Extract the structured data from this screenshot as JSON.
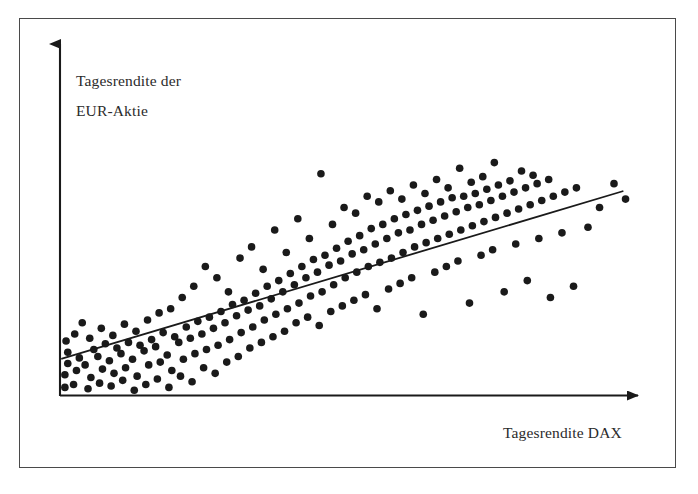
{
  "figure": {
    "type": "scatter-plot",
    "background_color": "#ffffff",
    "frame_color": "#4a4a4a",
    "axis_color": "#1a1a1a",
    "point_color": "#1a1a1a",
    "regression_line_color": "#1a1a1a",
    "text_color": "#2b2b2b"
  },
  "axes": {
    "y_label_line_1": "Tagesrendite der",
    "y_label_line_2": "EUR-Aktie",
    "x_label": "Tagesrendite DAX"
  },
  "chart_data": {
    "type": "scatter",
    "title": "",
    "xlabel": "Tagesrendite DAX",
    "ylabel": "Tagesrendite der EUR-Aktie",
    "xlim": [
      0,
      100
    ],
    "ylim": [
      0,
      100
    ],
    "grid": false,
    "legend": null,
    "axis_ticks": {
      "x": [],
      "y": []
    },
    "point_radius_px": 3.8,
    "regression_line": {
      "label": "",
      "x_start": 0.0,
      "y_start": 12.2,
      "x_end": 97.0,
      "y_end": 71.8
    },
    "points": [
      [
        0.5,
        2.0
      ],
      [
        0.5,
        6.5
      ],
      [
        1.0,
        10.5
      ],
      [
        1.0,
        14.5
      ],
      [
        0.7,
        18.5
      ],
      [
        2.0,
        3.0
      ],
      [
        2.5,
        8.0
      ],
      [
        3.0,
        12.5
      ],
      [
        2.2,
        21.0
      ],
      [
        3.5,
        25.0
      ],
      [
        4.5,
        1.5
      ],
      [
        5.0,
        5.5
      ],
      [
        4.0,
        10.0
      ],
      [
        5.5,
        15.5
      ],
      [
        4.8,
        19.5
      ],
      [
        6.5,
        3.5
      ],
      [
        7.0,
        8.5
      ],
      [
        6.2,
        13.0
      ],
      [
        7.5,
        17.5
      ],
      [
        6.8,
        23.0
      ],
      [
        8.5,
        2.5
      ],
      [
        9.0,
        7.0
      ],
      [
        8.2,
        11.5
      ],
      [
        9.5,
        16.0
      ],
      [
        8.8,
        20.5
      ],
      [
        10.5,
        4.5
      ],
      [
        11.0,
        9.0
      ],
      [
        10.2,
        14.0
      ],
      [
        11.5,
        18.0
      ],
      [
        10.8,
        24.5
      ],
      [
        12.5,
        1.0
      ],
      [
        13.0,
        6.0
      ],
      [
        12.2,
        12.0
      ],
      [
        13.5,
        17.0
      ],
      [
        12.8,
        22.0
      ],
      [
        14.5,
        3.0
      ],
      [
        15.0,
        10.0
      ],
      [
        14.2,
        15.0
      ],
      [
        15.5,
        19.0
      ],
      [
        14.8,
        26.0
      ],
      [
        16.5,
        5.0
      ],
      [
        17.0,
        11.0
      ],
      [
        16.2,
        16.5
      ],
      [
        17.5,
        21.5
      ],
      [
        16.8,
        28.5
      ],
      [
        18.5,
        2.0
      ],
      [
        19.0,
        8.0
      ],
      [
        18.2,
        13.5
      ],
      [
        19.5,
        20.0
      ],
      [
        18.8,
        30.0
      ],
      [
        20.5,
        6.0
      ],
      [
        21.0,
        12.0
      ],
      [
        20.2,
        18.0
      ],
      [
        21.5,
        23.5
      ],
      [
        20.8,
        34.0
      ],
      [
        22.5,
        4.0
      ],
      [
        23.0,
        14.0
      ],
      [
        22.2,
        19.5
      ],
      [
        23.5,
        25.5
      ],
      [
        22.8,
        38.0
      ],
      [
        24.5,
        9.0
      ],
      [
        25.0,
        15.5
      ],
      [
        24.2,
        21.0
      ],
      [
        25.5,
        27.0
      ],
      [
        24.8,
        45.0
      ],
      [
        26.5,
        7.0
      ],
      [
        27.0,
        17.0
      ],
      [
        26.2,
        23.0
      ],
      [
        27.5,
        29.0
      ],
      [
        26.8,
        41.0
      ],
      [
        28.5,
        11.0
      ],
      [
        29.0,
        19.0
      ],
      [
        28.2,
        25.0
      ],
      [
        29.5,
        31.5
      ],
      [
        28.8,
        36.0
      ],
      [
        30.5,
        13.0
      ],
      [
        31.0,
        21.5
      ],
      [
        30.2,
        27.5
      ],
      [
        31.5,
        33.0
      ],
      [
        30.8,
        48.0
      ],
      [
        32.5,
        16.0
      ],
      [
        33.0,
        23.5
      ],
      [
        32.2,
        29.5
      ],
      [
        33.5,
        35.5
      ],
      [
        32.8,
        52.0
      ],
      [
        34.5,
        18.0
      ],
      [
        35.0,
        26.0
      ],
      [
        34.2,
        31.0
      ],
      [
        35.5,
        38.0
      ],
      [
        34.8,
        44.0
      ],
      [
        36.5,
        20.0
      ],
      [
        37.0,
        28.0
      ],
      [
        36.2,
        33.5
      ],
      [
        37.5,
        40.0
      ],
      [
        36.8,
        58.0
      ],
      [
        38.5,
        22.0
      ],
      [
        39.0,
        30.0
      ],
      [
        38.2,
        36.0
      ],
      [
        39.5,
        42.5
      ],
      [
        38.8,
        50.0
      ],
      [
        40.5,
        25.0
      ],
      [
        41.0,
        32.0
      ],
      [
        40.2,
        38.5
      ],
      [
        41.5,
        45.0
      ],
      [
        40.8,
        62.0
      ],
      [
        42.5,
        27.0
      ],
      [
        43.0,
        34.5
      ],
      [
        42.2,
        41.0
      ],
      [
        43.5,
        47.5
      ],
      [
        42.8,
        55.0
      ],
      [
        44.5,
        24.0
      ],
      [
        45.0,
        36.0
      ],
      [
        44.2,
        43.0
      ],
      [
        45.5,
        49.0
      ],
      [
        44.8,
        78.0
      ],
      [
        46.5,
        29.0
      ],
      [
        47.0,
        38.5
      ],
      [
        46.2,
        45.5
      ],
      [
        47.5,
        51.5
      ],
      [
        46.8,
        60.0
      ],
      [
        48.5,
        31.0
      ],
      [
        49.0,
        41.0
      ],
      [
        48.2,
        47.0
      ],
      [
        49.5,
        54.0
      ],
      [
        48.8,
        66.0
      ],
      [
        50.5,
        33.0
      ],
      [
        51.0,
        43.0
      ],
      [
        50.2,
        49.5
      ],
      [
        51.5,
        56.0
      ],
      [
        50.8,
        64.0
      ],
      [
        52.5,
        35.0
      ],
      [
        53.0,
        45.0
      ],
      [
        52.2,
        51.0
      ],
      [
        53.5,
        58.5
      ],
      [
        52.8,
        70.0
      ],
      [
        54.5,
        30.0
      ],
      [
        55.0,
        46.5
      ],
      [
        54.2,
        53.0
      ],
      [
        55.5,
        60.0
      ],
      [
        54.8,
        68.0
      ],
      [
        56.5,
        37.0
      ],
      [
        57.0,
        48.0
      ],
      [
        56.2,
        55.0
      ],
      [
        57.5,
        62.0
      ],
      [
        56.8,
        72.0
      ],
      [
        58.5,
        39.0
      ],
      [
        59.0,
        50.0
      ],
      [
        58.2,
        57.0
      ],
      [
        59.5,
        63.5
      ],
      [
        58.8,
        69.0
      ],
      [
        60.5,
        41.0
      ],
      [
        61.0,
        52.0
      ],
      [
        60.2,
        58.0
      ],
      [
        61.5,
        65.0
      ],
      [
        60.8,
        74.0
      ],
      [
        62.5,
        28.0
      ],
      [
        63.0,
        53.5
      ],
      [
        62.2,
        60.0
      ],
      [
        63.5,
        66.5
      ],
      [
        62.8,
        71.0
      ],
      [
        64.5,
        43.0
      ],
      [
        65.0,
        55.0
      ],
      [
        64.2,
        61.5
      ],
      [
        65.5,
        68.0
      ],
      [
        64.8,
        76.0
      ],
      [
        66.5,
        45.0
      ],
      [
        67.0,
        56.5
      ],
      [
        66.2,
        63.0
      ],
      [
        67.5,
        69.5
      ],
      [
        66.8,
        73.0
      ],
      [
        68.5,
        47.0
      ],
      [
        69.0,
        58.0
      ],
      [
        68.2,
        64.5
      ],
      [
        69.5,
        70.0
      ],
      [
        68.8,
        80.0
      ],
      [
        70.5,
        32.0
      ],
      [
        71.0,
        59.5
      ],
      [
        70.2,
        66.0
      ],
      [
        71.5,
        71.0
      ],
      [
        70.8,
        75.0
      ],
      [
        72.5,
        49.0
      ],
      [
        73.0,
        61.0
      ],
      [
        72.2,
        67.0
      ],
      [
        73.5,
        72.5
      ],
      [
        72.8,
        77.0
      ],
      [
        74.5,
        51.0
      ],
      [
        75.0,
        62.5
      ],
      [
        74.2,
        68.5
      ],
      [
        75.5,
        74.0
      ],
      [
        74.8,
        82.0
      ],
      [
        76.5,
        36.0
      ],
      [
        77.0,
        64.0
      ],
      [
        76.2,
        70.0
      ],
      [
        77.5,
        75.5
      ],
      [
        78.5,
        53.0
      ],
      [
        79.0,
        65.5
      ],
      [
        78.2,
        71.5
      ],
      [
        79.5,
        79.0
      ],
      [
        80.5,
        40.0
      ],
      [
        81.0,
        67.0
      ],
      [
        80.2,
        73.0
      ],
      [
        81.5,
        77.5
      ],
      [
        82.5,
        55.0
      ],
      [
        83.0,
        68.5
      ],
      [
        82.2,
        74.5
      ],
      [
        84.5,
        34.0
      ],
      [
        85.0,
        70.0
      ],
      [
        84.2,
        76.0
      ],
      [
        86.5,
        57.0
      ],
      [
        87.0,
        71.5
      ],
      [
        88.5,
        38.0
      ],
      [
        89.0,
        73.0
      ],
      [
        91.0,
        59.0
      ],
      [
        93.0,
        66.0
      ],
      [
        95.5,
        74.5
      ],
      [
        97.5,
        69.0
      ]
    ]
  }
}
